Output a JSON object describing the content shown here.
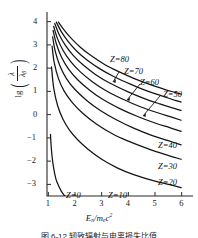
{
  "chart_data": {
    "type": "line",
    "title": "",
    "xlabel": "E_n/m_e c^2",
    "ylabel": "lg(lambda / lambda_beta)",
    "xlim": [
      0.95,
      6.35
    ],
    "ylim": [
      -3.5,
      4.2
    ],
    "grid": false,
    "legend_position": "inline-annotations",
    "xticks": [
      1,
      2,
      3,
      4,
      5,
      6
    ],
    "yticks": [
      4,
      3,
      2,
      1,
      0,
      -1,
      -2,
      -3
    ],
    "series": [
      {
        "name": "Z = 0",
        "label": "Z=0",
        "x": [
          1.08,
          1.1,
          1.14,
          1.2,
          1.28,
          1.38,
          1.48,
          1.56,
          1.62
        ],
        "y": [
          -0.85,
          -1.25,
          -1.8,
          -2.3,
          -2.75,
          -3.05,
          -3.28,
          -3.42,
          -3.5
        ]
      },
      {
        "name": "Z = 10",
        "label": "Z=10",
        "x": [
          1.12,
          1.2,
          1.35,
          1.55,
          1.8,
          2.1,
          2.5,
          3.0,
          3.6,
          4.2,
          4.9,
          5.5,
          5.98
        ],
        "y": [
          2.05,
          1.15,
          0.38,
          -0.2,
          -0.68,
          -1.08,
          -1.5,
          -1.92,
          -2.3,
          -2.58,
          -2.83,
          -3.0,
          -3.14
        ]
      },
      {
        "name": "Z = 20",
        "label": "Z=20",
        "x": [
          1.14,
          1.22,
          1.38,
          1.6,
          1.9,
          2.3,
          2.8,
          3.4,
          4.0,
          4.7,
          5.4,
          5.98
        ],
        "y": [
          2.95,
          2.25,
          1.55,
          1.0,
          0.52,
          0.05,
          -0.4,
          -0.82,
          -1.14,
          -1.45,
          -1.72,
          -1.92
        ]
      },
      {
        "name": "Z = 30",
        "label": "Z=30",
        "x": [
          1.16,
          1.26,
          1.44,
          1.68,
          2.0,
          2.45,
          2.95,
          3.55,
          4.2,
          4.9,
          5.5,
          5.98
        ],
        "y": [
          3.35,
          2.72,
          2.08,
          1.55,
          1.08,
          0.6,
          0.18,
          -0.22,
          -0.58,
          -0.9,
          -1.12,
          -1.3
        ]
      },
      {
        "name": "Z = 40",
        "label": "Z=40",
        "x": [
          1.18,
          1.3,
          1.5,
          1.76,
          2.1,
          2.55,
          3.05,
          3.7,
          4.35,
          5.0,
          5.55,
          5.98
        ],
        "y": [
          3.62,
          3.05,
          2.46,
          1.96,
          1.5,
          1.05,
          0.65,
          0.25,
          -0.08,
          -0.36,
          -0.56,
          -0.72
        ]
      },
      {
        "name": "Z = 50",
        "label": "Z=50",
        "x": [
          1.2,
          1.34,
          1.56,
          1.84,
          2.2,
          2.65,
          3.15,
          3.8,
          4.45,
          5.1,
          5.6,
          5.98
        ],
        "y": [
          3.8,
          3.28,
          2.75,
          2.28,
          1.84,
          1.42,
          1.04,
          0.66,
          0.34,
          0.08,
          -0.1,
          -0.24
        ]
      },
      {
        "name": "Z = 60",
        "label": "Z=60",
        "x": [
          1.24,
          1.4,
          1.64,
          1.94,
          2.32,
          2.78,
          3.3,
          3.95,
          4.58,
          5.18,
          5.62,
          5.98
        ],
        "y": [
          3.92,
          3.46,
          2.98,
          2.54,
          2.12,
          1.72,
          1.36,
          1.0,
          0.7,
          0.46,
          0.3,
          0.18
        ]
      },
      {
        "name": "Z = 70",
        "label": "Z=70",
        "x": [
          1.3,
          1.48,
          1.74,
          2.06,
          2.45,
          2.92,
          3.45,
          4.1,
          4.7,
          5.28,
          5.68,
          5.98
        ],
        "y": [
          3.98,
          3.58,
          3.15,
          2.74,
          2.35,
          1.98,
          1.64,
          1.3,
          1.02,
          0.8,
          0.64,
          0.54
        ]
      },
      {
        "name": "Z = 80",
        "label": "Z=80",
        "x": [
          1.38,
          1.58,
          1.86,
          2.2,
          2.6,
          3.08,
          3.62,
          4.25,
          4.85,
          5.38,
          5.74,
          5.98
        ],
        "y": [
          3.98,
          3.66,
          3.28,
          2.9,
          2.54,
          2.18,
          1.86,
          1.54,
          1.28,
          1.08,
          0.96,
          0.88
        ]
      }
    ],
    "annotations": [
      {
        "text": "Z=80",
        "x_px": 110,
        "y_px": 54,
        "leader": false
      },
      {
        "text": "Z=70",
        "x_px": 124,
        "y_px": 66,
        "leader": true
      },
      {
        "text": "Z=60",
        "x_px": 140,
        "y_px": 77,
        "leader": true
      },
      {
        "text": "Z=50",
        "x_px": 163,
        "y_px": 89,
        "leader": true
      },
      {
        "text": "Z=40",
        "x_px": 158,
        "y_px": 140,
        "leader": false
      },
      {
        "text": "Z=30",
        "x_px": 158,
        "y_px": 161,
        "leader": false
      },
      {
        "text": "Z=20",
        "x_px": 158,
        "y_px": 177,
        "leader": false
      },
      {
        "text": "Z=10",
        "x_px": 108,
        "y_px": 190,
        "leader": false
      },
      {
        "text": "Z=0",
        "x_px": 66,
        "y_px": 190,
        "leader": false
      }
    ]
  },
  "axes": {
    "ylabel_prefix": "lg",
    "ylabel_numerator": "λ",
    "ylabel_denominator": "λ",
    "ylabel_denominator_sub": "β",
    "xlabel_main": "E",
    "xlabel_main_sub": "n",
    "xlabel_div": "/m",
    "xlabel_div_sub": "e",
    "xlabel_c": "c",
    "xlabel_c_sup": "2",
    "xtick_labels": [
      "1",
      "2",
      "3",
      "4",
      "5",
      "6"
    ],
    "ytick_labels": [
      "4",
      "3",
      "2",
      "1",
      "0",
      "−1",
      "−2",
      "−3"
    ]
  },
  "style": {
    "curve_color": "#141414",
    "axis_color": "#2a2a2a",
    "background": "#ffffff"
  },
  "caption": {
    "text": "图 6-12  轫致辐射与电离损失比值"
  }
}
